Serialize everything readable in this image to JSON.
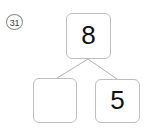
{
  "worksheet": {
    "problem_number": "31",
    "type": "number-bond",
    "whole": {
      "label": "8",
      "filled": true
    },
    "parts": [
      {
        "label": "",
        "filled": false
      },
      {
        "label": "5",
        "filled": true
      }
    ],
    "colors": {
      "background": "#ffffff",
      "box_border": "#bdbdbd",
      "connector_line": "#b0b0b0",
      "number_text": "#111111",
      "problem_number_text": "#3a3a3a",
      "problem_number_border": "#8a8a8a"
    }
  }
}
